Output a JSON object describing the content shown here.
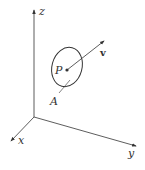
{
  "diagram": {
    "axes": {
      "x_label": "x",
      "y_label": "y",
      "z_label": "z"
    },
    "point_label": "P",
    "vector_label": "v",
    "area_label": "A",
    "colors": {
      "stroke": "#333333",
      "background": "#ffffff"
    }
  }
}
